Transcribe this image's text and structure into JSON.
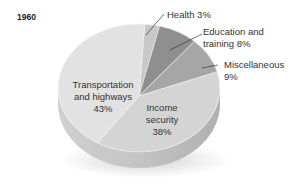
{
  "chart_data": {
    "type": "pie",
    "title": "1960",
    "slices": [
      {
        "label": "Health",
        "value": 3,
        "display": "Health  3%",
        "color": "#c8c8c8"
      },
      {
        "label": "Education and training",
        "value": 8,
        "display_lines": [
          "Education and",
          "training  8%"
        ],
        "color": "#8f8f8f"
      },
      {
        "label": "Miscellaneous",
        "value": 9,
        "display_lines": [
          "Miscellaneous",
          "9%"
        ],
        "color": "#a6a6a6"
      },
      {
        "label": "Income security",
        "value": 38,
        "display_lines": [
          "Income",
          "security",
          "38%"
        ],
        "color": "#d4d4d4"
      },
      {
        "label": "Transportation and highways",
        "value": 43,
        "display_lines": [
          "Transportation",
          "and highways",
          "43%"
        ],
        "color": "#e2e2e2"
      }
    ],
    "legend": "none (direct labels with leader lines)",
    "style": "3D tilted pie, grayscale"
  }
}
